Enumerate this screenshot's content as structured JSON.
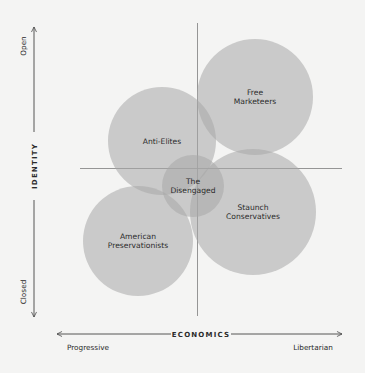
{
  "diagram": {
    "type": "overlapping-bubble-quadrant",
    "background": "#f4f4f3",
    "circle_fill": "#a8a8a8",
    "circle_opacity": 0.55,
    "axis_color": "#6e6e6e",
    "y_axis": {
      "title": "IDENTITY",
      "top_label": "Open",
      "bottom_label": "Closed"
    },
    "x_axis": {
      "title": "ECONOMICS",
      "left_label": "Progressive",
      "right_label": "Libertarian"
    },
    "groups": [
      {
        "id": "free-marketeers",
        "lines": [
          "Free",
          "Marketeers"
        ],
        "cx": 255,
        "cy": 97,
        "r": 58
      },
      {
        "id": "anti-elites",
        "lines": [
          "Anti-Elites"
        ],
        "cx": 162,
        "cy": 141,
        "r": 54
      },
      {
        "id": "american-preservationists",
        "lines": [
          "American",
          "Preservationists"
        ],
        "cx": 138,
        "cy": 241,
        "r": 55
      },
      {
        "id": "staunch-conservatives",
        "lines": [
          "Staunch",
          "Conservatives"
        ],
        "cx": 253,
        "cy": 212,
        "r": 63
      },
      {
        "id": "the-disengaged",
        "lines": [
          "The",
          "Disengaged"
        ],
        "cx": 193,
        "cy": 186,
        "r": 31
      }
    ]
  }
}
